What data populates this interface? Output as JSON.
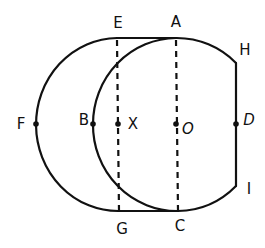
{
  "diagram": {
    "stroke_color": "#111111",
    "background": "#ffffff",
    "labels": {
      "E": "E",
      "A": "A",
      "H": "H",
      "F": "F",
      "B": "B",
      "X": "X",
      "O": "O",
      "D": "D",
      "I": "I",
      "G": "G",
      "C": "C"
    },
    "points": {
      "E": [
        117,
        38
      ],
      "A": [
        176,
        38
      ],
      "H": [
        236,
        63
      ],
      "F": [
        36,
        124
      ],
      "B": [
        93,
        124
      ],
      "X": [
        118,
        124
      ],
      "O": [
        176,
        124
      ],
      "D": [
        236,
        124
      ],
      "I": [
        236,
        186
      ],
      "G": [
        119,
        211
      ],
      "C": [
        178,
        211
      ]
    },
    "segments": [
      {
        "from": "E",
        "to": "A",
        "style": "solid"
      },
      {
        "from": "G",
        "to": "C",
        "style": "solid"
      },
      {
        "from": "H",
        "to": "I",
        "style": "solid"
      },
      {
        "from": "E",
        "to": "G",
        "style": "dashed"
      },
      {
        "from": "A",
        "to": "C",
        "style": "dashed"
      }
    ],
    "arcs": [
      {
        "name": "outer-left-semicircle",
        "center": "X",
        "through": [
          "E",
          "F",
          "G"
        ]
      },
      {
        "name": "inner-circle-arc",
        "center": "O",
        "through": [
          "A",
          "B",
          "C",
          "H",
          "I"
        ]
      }
    ]
  }
}
